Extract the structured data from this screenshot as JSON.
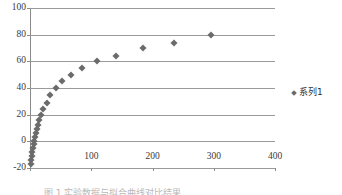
{
  "chart_data": {
    "type": "scatter",
    "title": "",
    "xlabel": "",
    "ylabel": "",
    "xlim": [
      0,
      400
    ],
    "ylim": [
      -20,
      100
    ],
    "grid": "horizontal",
    "legend_position": "right",
    "marker": "diamond",
    "marker_color": "#6b6b6b",
    "xticks": [
      0,
      100,
      200,
      300,
      400
    ],
    "xtick_labels": [
      "",
      "100",
      "200",
      "300",
      "400"
    ],
    "yticks": [
      -20,
      0,
      20,
      40,
      60,
      80,
      100
    ],
    "ytick_labels": [
      "-20",
      "0",
      "20",
      "40",
      "60",
      "80",
      "100"
    ],
    "series": [
      {
        "name": "系列1",
        "points": [
          [
            1,
            -17
          ],
          [
            2,
            -14
          ],
          [
            3,
            -11
          ],
          [
            4,
            -8
          ],
          [
            5,
            -5
          ],
          [
            6,
            -2
          ],
          [
            7,
            0
          ],
          [
            8,
            3
          ],
          [
            9,
            6
          ],
          [
            11,
            9
          ],
          [
            13,
            12
          ],
          [
            15,
            16
          ],
          [
            18,
            20
          ],
          [
            22,
            24
          ],
          [
            27,
            29
          ],
          [
            33,
            35
          ],
          [
            42,
            40
          ],
          [
            53,
            45
          ],
          [
            67,
            50
          ],
          [
            85,
            55
          ],
          [
            110,
            60
          ],
          [
            140,
            64
          ],
          [
            185,
            70
          ],
          [
            235,
            74
          ],
          [
            295,
            80
          ]
        ]
      }
    ]
  },
  "legend": {
    "entries": [
      {
        "label": "系列1",
        "marker": "diamond-marker"
      }
    ]
  },
  "caption": {
    "text": "图 1 实验数据与拟合曲线对比结果"
  }
}
